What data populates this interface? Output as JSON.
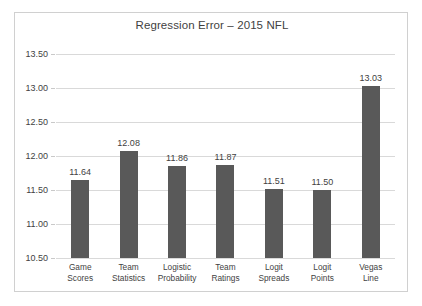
{
  "chart_data": {
    "type": "bar",
    "title": "Regression Error – 2015 NFL",
    "xlabel": "",
    "ylabel": "",
    "categories": [
      "Game Scores",
      "Team Statistics",
      "Logistic Probability",
      "Team Ratings",
      "Logit Spreads",
      "Logit Points",
      "Vegas Line"
    ],
    "category_lines": [
      [
        "Game",
        "Scores"
      ],
      [
        "Team",
        "Statistics"
      ],
      [
        "Logistic",
        "Probability"
      ],
      [
        "Team",
        "Ratings"
      ],
      [
        "Logit",
        "Spreads"
      ],
      [
        "Logit",
        "Points"
      ],
      [
        "Vegas",
        "Line"
      ]
    ],
    "values": [
      11.64,
      12.08,
      11.86,
      11.87,
      11.51,
      11.5,
      13.03
    ],
    "value_labels": [
      "11.64",
      "12.08",
      "11.86",
      "11.87",
      "11.51",
      "11.50",
      "13.03"
    ],
    "ylim": [
      10.5,
      13.5
    ],
    "ytick_values": [
      13.5,
      13.0,
      12.5,
      12.0,
      11.5,
      11.0,
      10.5
    ],
    "ytick_labels": [
      "13.50",
      "13.00",
      "12.50",
      "12.00",
      "11.50",
      "11.00",
      "10.50"
    ],
    "grid": true,
    "legend": false,
    "bar_color": "#595959",
    "grid_color": "#d9d9d9",
    "background_color": "#ffffff",
    "border_color": "#d0d0d0"
  }
}
